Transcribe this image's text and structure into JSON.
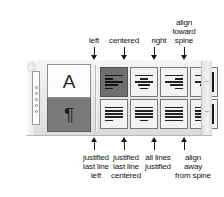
{
  "panel": {
    "name": "paragraph-alignment-palette",
    "grip": {
      "icon": "drag-grip-dots",
      "dot_count": 5,
      "knob_icon": "circle-knob"
    },
    "mode_tabs": [
      {
        "name": "character-formatting-tab",
        "glyph": "A",
        "state": "unselected"
      },
      {
        "name": "paragraph-formatting-tab",
        "glyph": "¶",
        "state": "selected"
      }
    ],
    "alignment_buttons": [
      {
        "id": "align-left",
        "row": 1,
        "col": 1,
        "state": "selected",
        "lines": [
          "full",
          "short",
          "full",
          "mid",
          "short"
        ],
        "align": "left",
        "spine_bar": false
      },
      {
        "id": "align-center",
        "row": 1,
        "col": 2,
        "state": "unselected",
        "lines": [
          "full",
          "short",
          "full",
          "mid",
          "short"
        ],
        "align": "center",
        "spine_bar": false
      },
      {
        "id": "align-right",
        "row": 1,
        "col": 3,
        "state": "unselected",
        "lines": [
          "full",
          "short",
          "full",
          "mid",
          "short"
        ],
        "align": "right",
        "spine_bar": false
      },
      {
        "id": "align-toward-spine",
        "row": 1,
        "col": 4,
        "state": "unselected",
        "lines": [
          "full",
          "short",
          "full",
          "mid",
          "short"
        ],
        "align": "right",
        "spine_bar": true
      },
      {
        "id": "justify-last-line-left",
        "row": 2,
        "col": 1,
        "state": "unselected",
        "lines": [
          "full",
          "full",
          "full",
          "full",
          "short"
        ],
        "align": "left",
        "spine_bar": false
      },
      {
        "id": "justify-last-line-center",
        "row": 2,
        "col": 2,
        "state": "unselected",
        "lines": [
          "full",
          "full",
          "full",
          "full",
          "short"
        ],
        "align": "center",
        "spine_bar": false
      },
      {
        "id": "justify-all-lines",
        "row": 2,
        "col": 3,
        "state": "unselected",
        "lines": [
          "full",
          "full",
          "full",
          "full",
          "full"
        ],
        "align": "left",
        "spine_bar": false
      },
      {
        "id": "align-away-from-spine",
        "row": 2,
        "col": 4,
        "state": "unselected",
        "lines": [
          "full",
          "short",
          "full",
          "mid",
          "short"
        ],
        "align": "left",
        "spine_bar": true
      }
    ]
  },
  "callouts": {
    "top": [
      {
        "name": "callout-left",
        "text": "left",
        "target": "align-left"
      },
      {
        "name": "callout-centered",
        "text": "centered",
        "target": "align-center"
      },
      {
        "name": "callout-right",
        "text": "right",
        "target": "align-right"
      },
      {
        "name": "callout-toward-spine",
        "text": "align\ntoward\nspine",
        "target": "align-toward-spine"
      }
    ],
    "bottom": [
      {
        "name": "callout-justified-last-line-left",
        "text": "justified\nlast line\nleft",
        "target": "justify-last-line-left"
      },
      {
        "name": "callout-justified-last-line-centered",
        "text": "justified\nlast line\ncentered",
        "target": "justify-last-line-center"
      },
      {
        "name": "callout-all-lines-justified",
        "text": "all lines\njustified",
        "target": "justify-all-lines"
      },
      {
        "name": "callout-align-away-from-spine",
        "text": "align\naway\nfrom spine",
        "target": "align-away-from-spine"
      }
    ]
  },
  "colors": {
    "ink": "#111111",
    "panel_light": "#f4f4f4",
    "panel_dark": "#dcdcdc",
    "button_face": "#f2f2f2",
    "button_selected": "#6f6f6f",
    "line_ink": "#222222",
    "border": "#787878"
  }
}
